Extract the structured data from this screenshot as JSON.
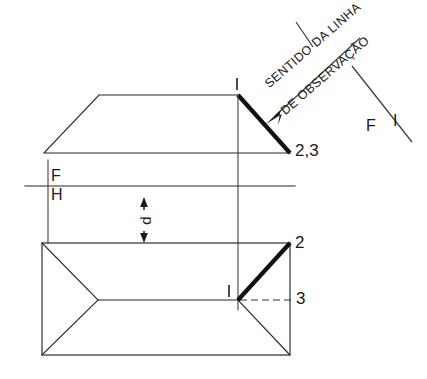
{
  "drawing": {
    "title": "Vista superior e vista frontal com sentido da linha de observacao",
    "background_color": "#ffffff",
    "line_color": "#262626",
    "emphasis_color": "#111111",
    "annotations": {
      "note_line_1": "SENTIDO DA LINHA",
      "note_line_2": "DE OBSERVAÇÃO",
      "ref_f_top": "F",
      "ref_h_bottom": "H",
      "ref_f_right": "F",
      "ref_i_right": "I",
      "dimension_d": "d"
    },
    "point_labels": {
      "top_view_point_1": "I",
      "top_view_points_2_3": "2,3",
      "front_view_point_1": "I",
      "front_view_point_2": "2",
      "front_view_point_3": "3"
    },
    "views": {
      "top_view": {
        "name": "top-view-trapezoid",
        "shape": "trapezoid",
        "vertices": [
          [
            44,
            153
          ],
          [
            99,
            95
          ],
          [
            238,
            95
          ],
          [
            290,
            153
          ]
        ],
        "emphasized_edge": [
          [
            238,
            95
          ],
          [
            290,
            153
          ]
        ]
      },
      "front_view": {
        "name": "front-view-rectangle",
        "shape": "rectangle-with-hip-lines",
        "vertices": [
          [
            42,
            243
          ],
          [
            290,
            243
          ],
          [
            290,
            355
          ],
          [
            42,
            355
          ]
        ],
        "ridge": [
          [
            98,
            300
          ],
          [
            238,
            300
          ]
        ],
        "hip_lines": [
          [
            [
              42,
              243
            ],
            [
              98,
              300
            ]
          ],
          [
            [
              42,
              355
            ],
            [
              98,
              300
            ]
          ],
          [
            [
              290,
              243
            ],
            [
              238,
              300
            ]
          ],
          [
            [
              290,
              355
            ],
            [
              238,
              300
            ]
          ]
        ],
        "emphasized_edge": [
          [
            238,
            300
          ],
          [
            290,
            243
          ]
        ],
        "hidden_edge": [
          [
            238,
            300
          ],
          [
            290,
            300
          ]
        ]
      },
      "reference_line": {
        "name": "fh-reference-line",
        "y": 186,
        "x_start": 25,
        "x_end": 295
      },
      "projection_line": {
        "name": "vertical-projection-line",
        "x": 238,
        "y_start": 95,
        "y_end": 310
      },
      "extension_line": {
        "name": "left-extension-line",
        "x": 48,
        "y_start": 160,
        "y_end": 243
      },
      "sight_arrow": {
        "name": "observation-direction-arrow",
        "from": [
          360,
          38
        ],
        "to": [
          268,
          122
        ]
      },
      "fi_line": {
        "name": "fi-divider-line",
        "from": [
          350,
          68
        ],
        "to": [
          410,
          140
        ]
      },
      "note_tick": {
        "name": "note-tick-line",
        "from": [
          295,
          22
        ],
        "to": [
          312,
          48
        ]
      }
    }
  }
}
